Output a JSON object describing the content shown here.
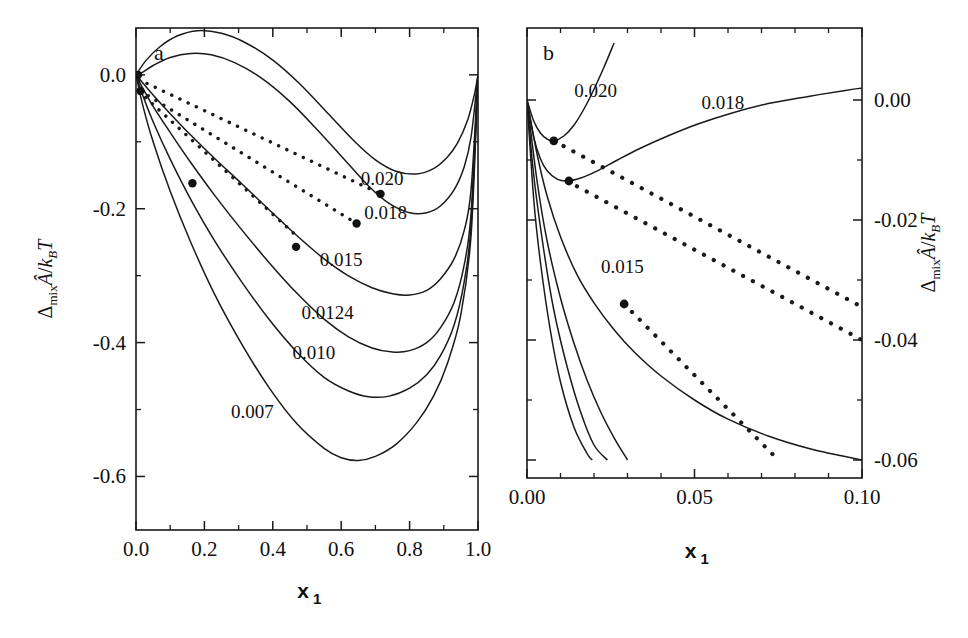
{
  "figure": {
    "panel_a_label": "a",
    "panel_b_label": "b",
    "xlabel_main": "x",
    "xlabel_sub": "1",
    "ylabel_delta": "Δ",
    "ylabel_mix": "mix",
    "ylabel_ahat": "Â",
    "ylabel_slash": "/",
    "ylabel_k": "k",
    "ylabel_B": "B",
    "ylabel_T": "T"
  },
  "chart_data": [
    {
      "type": "line",
      "panel": "a",
      "title": "a",
      "xlabel": "x1",
      "ylabel": "Delta_mix A-hat / k_B T",
      "xlim": [
        0.0,
        1.0
      ],
      "ylim": [
        -0.68,
        0.07
      ],
      "xticks": [
        0.0,
        0.2,
        0.4,
        0.6,
        0.8,
        1.0
      ],
      "xticklabels": [
        "0.0",
        "0.2",
        "0.4",
        "0.6",
        "0.8",
        "1.0"
      ],
      "yticks": [
        0.0,
        -0.2,
        -0.4,
        -0.6
      ],
      "yticklabels": [
        "0.0",
        "-0.2",
        "-0.4",
        "-0.6"
      ],
      "minor_ticks": true,
      "grid": false,
      "legend": "inline-curve-labels",
      "series": [
        {
          "name": "0.020",
          "label": "0.020",
          "label_x": 0.72,
          "label_y": -0.165,
          "points": [
            [
              0.0,
              0.0
            ],
            [
              0.03,
              0.022
            ],
            [
              0.07,
              0.042
            ],
            [
              0.12,
              0.058
            ],
            [
              0.18,
              0.066
            ],
            [
              0.25,
              0.062
            ],
            [
              0.32,
              0.048
            ],
            [
              0.4,
              0.022
            ],
            [
              0.48,
              -0.014
            ],
            [
              0.56,
              -0.057
            ],
            [
              0.64,
              -0.1
            ],
            [
              0.7,
              -0.127
            ],
            [
              0.76,
              -0.144
            ],
            [
              0.82,
              -0.148
            ],
            [
              0.87,
              -0.14
            ],
            [
              0.91,
              -0.123
            ],
            [
              0.94,
              -0.102
            ],
            [
              0.97,
              -0.067
            ],
            [
              0.99,
              -0.028
            ],
            [
              1.0,
              0.0
            ]
          ]
        },
        {
          "name": "0.018",
          "label": "0.018",
          "label_x": 0.73,
          "label_y": -0.215,
          "points": [
            [
              0.0,
              0.0
            ],
            [
              0.02,
              0.004
            ],
            [
              0.05,
              0.014
            ],
            [
              0.1,
              0.026
            ],
            [
              0.16,
              0.032
            ],
            [
              0.22,
              0.03
            ],
            [
              0.29,
              0.018
            ],
            [
              0.37,
              -0.006
            ],
            [
              0.45,
              -0.04
            ],
            [
              0.53,
              -0.082
            ],
            [
              0.61,
              -0.127
            ],
            [
              0.68,
              -0.166
            ],
            [
              0.74,
              -0.192
            ],
            [
              0.8,
              -0.206
            ],
            [
              0.85,
              -0.206
            ],
            [
              0.89,
              -0.196
            ],
            [
              0.93,
              -0.172
            ],
            [
              0.96,
              -0.137
            ],
            [
              0.98,
              -0.092
            ],
            [
              1.0,
              0.0
            ]
          ]
        },
        {
          "name": "0.015",
          "label": "0.015",
          "label_x": 0.6,
          "label_y": -0.285,
          "points": [
            [
              0.0,
              0.0
            ],
            [
              0.02,
              -0.012
            ],
            [
              0.05,
              -0.03
            ],
            [
              0.1,
              -0.058
            ],
            [
              0.16,
              -0.09
            ],
            [
              0.23,
              -0.125
            ],
            [
              0.31,
              -0.163
            ],
            [
              0.39,
              -0.202
            ],
            [
              0.47,
              -0.24
            ],
            [
              0.55,
              -0.275
            ],
            [
              0.62,
              -0.3
            ],
            [
              0.69,
              -0.318
            ],
            [
              0.75,
              -0.327
            ],
            [
              0.8,
              -0.329
            ],
            [
              0.85,
              -0.322
            ],
            [
              0.89,
              -0.305
            ],
            [
              0.93,
              -0.275
            ],
            [
              0.96,
              -0.232
            ],
            [
              0.98,
              -0.17
            ],
            [
              1.0,
              0.0
            ]
          ]
        },
        {
          "name": "0.0124",
          "label": "0.0124",
          "label_x": 0.56,
          "label_y": -0.365,
          "points": [
            [
              0.0,
              0.0
            ],
            [
              0.02,
              -0.02
            ],
            [
              0.05,
              -0.047
            ],
            [
              0.1,
              -0.086
            ],
            [
              0.16,
              -0.131
            ],
            [
              0.23,
              -0.18
            ],
            [
              0.31,
              -0.232
            ],
            [
              0.39,
              -0.281
            ],
            [
              0.47,
              -0.326
            ],
            [
              0.55,
              -0.365
            ],
            [
              0.62,
              -0.391
            ],
            [
              0.69,
              -0.408
            ],
            [
              0.75,
              -0.414
            ],
            [
              0.8,
              -0.412
            ],
            [
              0.85,
              -0.4
            ],
            [
              0.89,
              -0.378
            ],
            [
              0.93,
              -0.34
            ],
            [
              0.96,
              -0.283
            ],
            [
              0.98,
              -0.205
            ],
            [
              1.0,
              0.0
            ]
          ]
        },
        {
          "name": "0.010",
          "label": "0.010",
          "label_x": 0.52,
          "label_y": -0.425,
          "points": [
            [
              0.0,
              0.0
            ],
            [
              0.02,
              -0.031
            ],
            [
              0.05,
              -0.07
            ],
            [
              0.1,
              -0.126
            ],
            [
              0.16,
              -0.186
            ],
            [
              0.23,
              -0.248
            ],
            [
              0.31,
              -0.31
            ],
            [
              0.39,
              -0.366
            ],
            [
              0.47,
              -0.414
            ],
            [
              0.55,
              -0.452
            ],
            [
              0.62,
              -0.472
            ],
            [
              0.68,
              -0.481
            ],
            [
              0.74,
              -0.48
            ],
            [
              0.8,
              -0.468
            ],
            [
              0.85,
              -0.448
            ],
            [
              0.89,
              -0.42
            ],
            [
              0.93,
              -0.374
            ],
            [
              0.96,
              -0.308
            ],
            [
              0.98,
              -0.222
            ],
            [
              1.0,
              0.0
            ]
          ]
        },
        {
          "name": "0.007",
          "label": "0.007",
          "label_x": 0.34,
          "label_y": -0.512,
          "points": [
            [
              0.0,
              0.0
            ],
            [
              0.02,
              -0.046
            ],
            [
              0.05,
              -0.1
            ],
            [
              0.1,
              -0.174
            ],
            [
              0.16,
              -0.25
            ],
            [
              0.23,
              -0.328
            ],
            [
              0.31,
              -0.403
            ],
            [
              0.39,
              -0.468
            ],
            [
              0.47,
              -0.521
            ],
            [
              0.55,
              -0.558
            ],
            [
              0.6,
              -0.572
            ],
            [
              0.65,
              -0.576
            ],
            [
              0.7,
              -0.57
            ],
            [
              0.76,
              -0.552
            ],
            [
              0.82,
              -0.52
            ],
            [
              0.87,
              -0.48
            ],
            [
              0.91,
              -0.432
            ],
            [
              0.95,
              -0.358
            ],
            [
              0.98,
              -0.238
            ],
            [
              1.0,
              0.0
            ]
          ]
        }
      ],
      "tie_lines": [
        {
          "name": "tie-0.020",
          "from": [
            0.008,
            -0.007
          ],
          "to": [
            0.715,
            -0.178
          ]
        },
        {
          "name": "tie-0.018",
          "from": [
            0.013,
            -0.024
          ],
          "to": [
            0.645,
            -0.222
          ]
        },
        {
          "name": "tie-0.015",
          "from": [
            0.028,
            -0.034
          ],
          "to": [
            0.468,
            -0.24
          ]
        }
      ],
      "markers": [
        {
          "name": "coexist-point",
          "x": 0.006,
          "y": 0.0
        },
        {
          "name": "coexist-point",
          "x": 0.013,
          "y": -0.024
        },
        {
          "name": "coexist-point",
          "x": 0.165,
          "y": -0.162
        },
        {
          "name": "coexist-point",
          "x": 0.468,
          "y": -0.257
        },
        {
          "name": "coexist-point",
          "x": 0.645,
          "y": -0.222
        },
        {
          "name": "coexist-point",
          "x": 0.715,
          "y": -0.178
        }
      ]
    },
    {
      "type": "line",
      "panel": "b",
      "title": "b",
      "xlabel": "x1",
      "ylabel": "Delta_mix A-hat / k_B T",
      "xlim": [
        0.0,
        0.1
      ],
      "ylim": [
        -0.063,
        0.012
      ],
      "xticks": [
        0.0,
        0.05,
        0.1
      ],
      "xticklabels": [
        "0.00",
        "0.05",
        "0.10"
      ],
      "yticks": [
        0.0,
        -0.02,
        -0.04,
        -0.06
      ],
      "yticklabels": [
        "0.00",
        "-0.02",
        "-0.04",
        "-0.06"
      ],
      "minor_ticks": true,
      "grid": false,
      "legend": "inline-curve-labels",
      "series": [
        {
          "name": "0.020",
          "label": "0.020",
          "label_x": 0.0205,
          "label_y": 0.0005,
          "points": [
            [
              0.0,
              0.0
            ],
            [
              0.002,
              -0.0035
            ],
            [
              0.004,
              -0.0055
            ],
            [
              0.006,
              -0.0065
            ],
            [
              0.008,
              -0.0068
            ],
            [
              0.011,
              -0.006
            ],
            [
              0.014,
              -0.0042
            ],
            [
              0.017,
              -0.0015
            ],
            [
              0.02,
              0.0018
            ],
            [
              0.023,
              0.0055
            ],
            [
              0.026,
              0.0095
            ]
          ]
        },
        {
          "name": "0.018",
          "label": "0.018",
          "label_x": 0.0585,
          "label_y": -0.0015,
          "points": [
            [
              0.0,
              0.0
            ],
            [
              0.002,
              -0.0062
            ],
            [
              0.004,
              -0.0098
            ],
            [
              0.006,
              -0.0118
            ],
            [
              0.009,
              -0.0132
            ],
            [
              0.012,
              -0.0135
            ],
            [
              0.016,
              -0.013
            ],
            [
              0.021,
              -0.0118
            ],
            [
              0.027,
              -0.01
            ],
            [
              0.034,
              -0.008
            ],
            [
              0.042,
              -0.006
            ],
            [
              0.051,
              -0.004
            ],
            [
              0.061,
              -0.0022
            ],
            [
              0.072,
              -0.0006
            ],
            [
              0.084,
              0.0006
            ],
            [
              0.095,
              0.0016
            ],
            [
              0.1,
              0.002
            ]
          ]
        },
        {
          "name": "0.015",
          "label": "0.015",
          "label_x": 0.0285,
          "label_y": -0.0288,
          "points": [
            [
              0.0,
              0.0
            ],
            [
              0.003,
              -0.009
            ],
            [
              0.006,
              -0.016
            ],
            [
              0.01,
              -0.0228
            ],
            [
              0.015,
              -0.0292
            ],
            [
              0.02,
              -0.0338
            ],
            [
              0.026,
              -0.0383
            ],
            [
              0.032,
              -0.042
            ],
            [
              0.04,
              -0.046
            ],
            [
              0.05,
              -0.05
            ],
            [
              0.06,
              -0.0532
            ],
            [
              0.072,
              -0.056
            ],
            [
              0.085,
              -0.0582
            ],
            [
              0.1,
              -0.06
            ]
          ]
        },
        {
          "name": "0.0124",
          "label": "",
          "points": [
            [
              0.0,
              0.0
            ],
            [
              0.003,
              -0.0135
            ],
            [
              0.006,
              -0.0235
            ],
            [
              0.01,
              -0.033
            ],
            [
              0.014,
              -0.0405
            ],
            [
              0.018,
              -0.0468
            ],
            [
              0.022,
              -0.052
            ],
            [
              0.026,
              -0.0563
            ],
            [
              0.03,
              -0.06
            ]
          ]
        },
        {
          "name": "0.010",
          "label": "",
          "points": [
            [
              0.0,
              0.0
            ],
            [
              0.002,
              -0.0125
            ],
            [
              0.005,
              -0.025
            ],
            [
              0.008,
              -0.035
            ],
            [
              0.012,
              -0.0445
            ],
            [
              0.016,
              -0.052
            ],
            [
              0.02,
              -0.0575
            ],
            [
              0.024,
              -0.06
            ]
          ]
        },
        {
          "name": "0.007",
          "label": "",
          "points": [
            [
              0.0,
              0.0
            ],
            [
              0.002,
              -0.0165
            ],
            [
              0.004,
              -0.027
            ],
            [
              0.007,
              -0.0385
            ],
            [
              0.01,
              -0.047
            ],
            [
              0.014,
              -0.0545
            ],
            [
              0.018,
              -0.059
            ],
            [
              0.0195,
              -0.06
            ]
          ]
        }
      ],
      "tie_lines": [
        {
          "name": "tie-0.020",
          "from": [
            0.008,
            -0.0068
          ],
          "to": [
            0.1,
            -0.0345
          ]
        },
        {
          "name": "tie-0.018",
          "from": [
            0.012,
            -0.0135
          ],
          "to": [
            0.1,
            -0.04
          ]
        },
        {
          "name": "tie-0.015",
          "from": [
            0.029,
            -0.034
          ],
          "to": [
            0.075,
            -0.06
          ]
        }
      ],
      "markers": [
        {
          "name": "coexist-point",
          "x": 0.008,
          "y": -0.0068
        },
        {
          "name": "coexist-point",
          "x": 0.0125,
          "y": -0.0135
        },
        {
          "name": "coexist-point",
          "x": 0.029,
          "y": -0.034
        }
      ]
    }
  ]
}
